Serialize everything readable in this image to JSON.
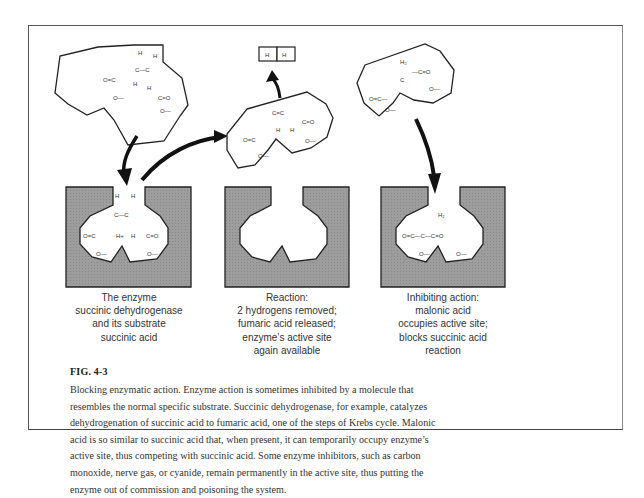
{
  "figure": {
    "label": "FIG. 4-3",
    "caption_lines": [
      "Blocking enzymatic action. Enzyme action is sometimes inhibited by a molecule that",
      "resembles the normal specific substrate. Succinic dehydrogenase, for example, catalyzes",
      "dehydrogenation of succinic acid to fumaric acid, one of the steps of Krebs cycle. Malonic",
      "acid is so similar to succinic acid that, when present, it can temporarily occupy enzyme’s",
      "active site, thus competing with succinic acid. Some enzyme inhibitors, such as carbon",
      "monoxide, nerve gas, or cyanide, remain permanently in the active site, thus putting the",
      "enzyme out of commission and poisoning the system."
    ]
  },
  "panels": [
    {
      "id": "substrate-binding",
      "caption_lines": [
        "The enzyme",
        "succinic dehydrogenase",
        "and its substrate",
        "succinic acid"
      ],
      "molecule": "succinic acid",
      "molecule_labels": [
        "H",
        "H",
        "C—C",
        "H",
        "H",
        "O=C",
        "C=O",
        "O—",
        "O—"
      ]
    },
    {
      "id": "reaction",
      "caption_lines": [
        "Reaction:",
        "2 hydrogens removed;",
        "fumaric acid released;",
        "enzyme’s active site",
        "again available"
      ],
      "molecule": "fumaric acid",
      "released_labels": [
        "H",
        "H"
      ],
      "molecule_labels": [
        "C=C",
        "H",
        "H",
        "O=C",
        "C=O",
        "O—",
        "O—"
      ]
    },
    {
      "id": "inhibition",
      "caption_lines": [
        "Inhibiting action:",
        "malonic acid",
        "occupies active site;",
        "blocks succinic acid",
        "reaction"
      ],
      "molecule": "malonic acid",
      "molecule_labels": [
        "H₂",
        "O=C—C—C=O",
        "O—",
        "O—"
      ]
    }
  ],
  "colors": {
    "enzyme_fill": "#9b9b9b",
    "outline": "#222222",
    "background": "#ffffff"
  }
}
